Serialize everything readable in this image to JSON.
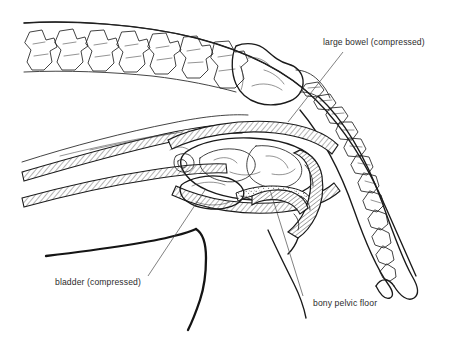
{
  "figure": {
    "background_color": "#ffffff",
    "ink_color": "#1a1a1a",
    "label_color": "#2b2b2b",
    "leader_color": "#4a4a4a"
  },
  "labels": [
    {
      "id": "large-bowel",
      "text": "large bowel (compressed)",
      "x": 323,
      "y": 45,
      "anchor": "start",
      "leader": {
        "x1": 343,
        "y1": 52,
        "x2": 288,
        "y2": 122
      }
    },
    {
      "id": "bladder",
      "text": "bladder (compressed)",
      "x": 55,
      "y": 285,
      "anchor": "start",
      "leader": {
        "x1": 148,
        "y1": 276,
        "x2": 205,
        "y2": 190
      }
    },
    {
      "id": "bony-pelvic-floor",
      "text": "bony pelvic floor",
      "x": 313,
      "y": 306,
      "anchor": "start",
      "leader": {
        "x1": 303,
        "y1": 296,
        "x2": 270,
        "y2": 190
      }
    }
  ],
  "structures": [
    {
      "id": "lumbar-vertebrae",
      "name": "lumbar vertebrae",
      "count": 7,
      "region": "top-left"
    },
    {
      "id": "sacrum",
      "name": "sacrum",
      "region": "top-center-right"
    },
    {
      "id": "caudal-vertebrae",
      "name": "caudal (tail) vertebrae",
      "region": "right"
    },
    {
      "id": "dorsal-body-contour",
      "name": "dorsal body contour",
      "region": "top"
    },
    {
      "id": "tail-contour",
      "name": "tail contour",
      "region": "right"
    },
    {
      "id": "abdominal-wall",
      "name": "abdominal wall (hatched)",
      "region": "left-center"
    },
    {
      "id": "large-bowel-mass",
      "name": "large bowel (compressed, faecal mass)",
      "region": "center"
    },
    {
      "id": "bladder-outline",
      "name": "bladder (compressed)",
      "region": "center-lower"
    },
    {
      "id": "pelvic-floor-bone",
      "name": "bony pelvic floor (hatched)",
      "region": "center-right-lower"
    },
    {
      "id": "ventral-body-contour",
      "name": "ventral body contour / hind limb",
      "region": "bottom-left"
    }
  ]
}
